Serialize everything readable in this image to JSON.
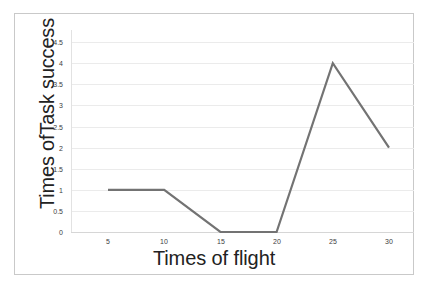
{
  "chart_data": {
    "type": "line",
    "title": "",
    "xlabel": "Times of flight",
    "ylabel": "Times ofTask success",
    "x": [
      5,
      10,
      15,
      20,
      25,
      30
    ],
    "categories": [
      "5",
      "10",
      "15",
      "20",
      "25",
      "30"
    ],
    "values": [
      1,
      1,
      0,
      0,
      4,
      2
    ],
    "series": [
      {
        "name": "Task success",
        "values": [
          1,
          1,
          0,
          0,
          4,
          2
        ]
      }
    ],
    "ylim": [
      0,
      4.5
    ],
    "y_ticks": [
      0,
      0.5,
      1,
      1.5,
      2,
      2.5,
      3,
      3.5,
      4,
      4.5
    ],
    "y_tick_labels": [
      "0",
      "0.5",
      "1",
      "1.5",
      "2",
      "2.5",
      "3",
      "3.5",
      "4",
      "4.5"
    ],
    "x_tick_labels": [
      "5",
      "10",
      "15",
      "20",
      "25",
      "30"
    ],
    "grid": true,
    "grid_axis": "y",
    "legend": false,
    "legend_position": "none",
    "line_color": "#737373",
    "grid_color": "#ebebeb",
    "axis_color": "#d6d6d6",
    "background_color": "#ffffff",
    "border_color": "#c9c9c9"
  }
}
